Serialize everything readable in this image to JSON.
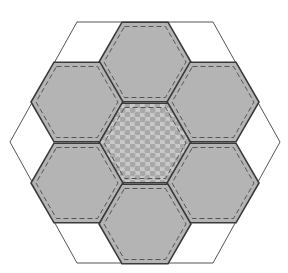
{
  "diagram": {
    "outer_shape": "hexagon",
    "colors": {
      "background": "#ffffff",
      "hex_fill": "#b4b4b4",
      "center_fill": "#c6c6c6",
      "dot_color": "#a9a9a9",
      "outline": "#3a3a3a",
      "stitch": "#555555",
      "outer_line": "#555555"
    },
    "hexagons": [
      {
        "id": "top",
        "cx": 145,
        "cy": 62,
        "pattern": "solid"
      },
      {
        "id": "upper-left",
        "cx": 77,
        "cy": 102,
        "pattern": "solid"
      },
      {
        "id": "upper-right",
        "cx": 213,
        "cy": 102,
        "pattern": "solid"
      },
      {
        "id": "center",
        "cx": 145,
        "cy": 143,
        "pattern": "polka-dot"
      },
      {
        "id": "lower-left",
        "cx": 77,
        "cy": 183,
        "pattern": "solid"
      },
      {
        "id": "lower-right",
        "cx": 213,
        "cy": 183,
        "pattern": "solid"
      },
      {
        "id": "bottom",
        "cx": 145,
        "cy": 224,
        "pattern": "solid"
      }
    ],
    "hex_radius": 46
  }
}
